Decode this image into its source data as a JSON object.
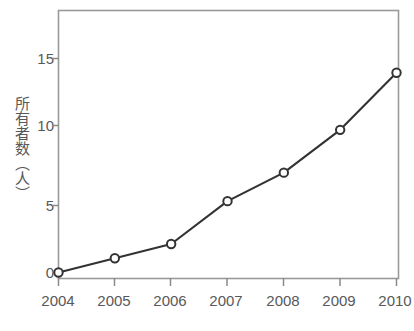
{
  "chart_data": {
    "type": "line",
    "title": "",
    "xlabel": "",
    "ylabel": "所有者数（人）",
    "categories": [
      "2004",
      "2005",
      "2006",
      "2007",
      "2008",
      "2009",
      "2010"
    ],
    "x": [
      2004,
      2005,
      2006,
      2007,
      2008,
      2009,
      2010
    ],
    "values": [
      0,
      1,
      2,
      5,
      7,
      10,
      14
    ],
    "series": [
      {
        "name": "所有者数",
        "values": [
          0,
          1,
          2,
          5,
          7,
          10,
          14
        ]
      }
    ],
    "ylim": [
      0,
      17.5
    ],
    "xlim": [
      2004,
      2010
    ],
    "yticks": [
      0,
      5,
      10,
      15
    ],
    "ytick_labels": [
      "0",
      "5",
      "10",
      "15"
    ],
    "xtick_labels": [
      "2004",
      "2005",
      "2006",
      "2007",
      "2008",
      "2009",
      "2010"
    ],
    "grid": false,
    "legend": false,
    "marker": "open-circle",
    "line_color": "#333333",
    "marker_color": "#333333",
    "marker_fill": "#ffffff",
    "axis_color": "#888888",
    "text_color": "#58585a",
    "background": "#ffffff"
  }
}
